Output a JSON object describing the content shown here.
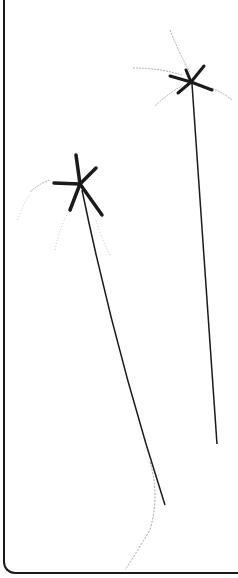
{
  "illustration": {
    "subject": "botanical drawing of two sedge flower heads on long stems",
    "colors": {
      "ink": "#1a1a1a",
      "background": "#ffffff",
      "faint": "#9a9a9a"
    },
    "plants": [
      {
        "name": "upper-flower-head",
        "head_center": [
          192,
          82
        ],
        "stem_end": [
          217,
          444
        ]
      },
      {
        "name": "lower-flower-head",
        "head_center": [
          80,
          188
        ],
        "stem_end": [
          165,
          505
        ]
      }
    ]
  }
}
